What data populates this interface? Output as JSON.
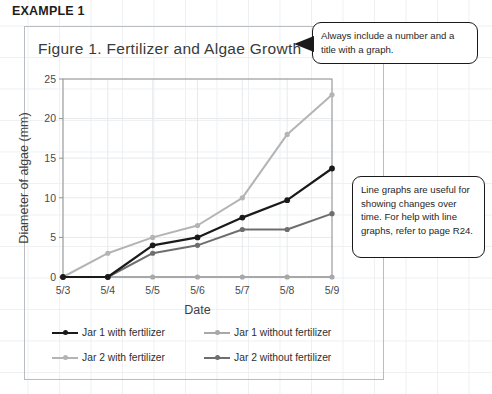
{
  "heading": "EXAMPLE 1",
  "figure": {
    "title": "Figure 1. Fertilizer and Algae Growth"
  },
  "callouts": [
    {
      "name": "title-note",
      "text": "Always include a number and a title with a graph."
    },
    {
      "name": "usage-note",
      "text": "Line graphs are useful for showing changes over time. For help with line graphs, refer to page R24."
    }
  ],
  "legend": {
    "items": [
      {
        "label": "Jar 1 with fertilizer",
        "color": "#1a1a1a"
      },
      {
        "label": "Jar 1 without fertilizer",
        "color": "#a8a8a8"
      },
      {
        "label": "Jar 2 with fertilizer",
        "color": "#b4b4b4"
      },
      {
        "label": "Jar 2 without fertilizer",
        "color": "#6e6e6e"
      }
    ]
  },
  "chart_data": {
    "type": "line",
    "title": "Figure 1. Fertilizer and Algae Growth",
    "xlabel": "Date",
    "ylabel": "Diameter of algae (mm)",
    "categories": [
      "5/3",
      "5/4",
      "5/5",
      "5/6",
      "5/7",
      "5/8",
      "5/9"
    ],
    "ylim": [
      0,
      25
    ],
    "yticks": [
      0,
      5,
      10,
      15,
      20,
      25
    ],
    "grid": true,
    "legend_position": "bottom",
    "series": [
      {
        "name": "Jar 1 with fertilizer",
        "color": "#1a1a1a",
        "values": [
          0,
          0,
          4,
          5,
          7.5,
          9.7,
          13.7
        ]
      },
      {
        "name": "Jar 1 without fertilizer",
        "color": "#a8a8a8",
        "values": [
          0,
          0,
          0,
          0,
          0,
          0,
          0
        ]
      },
      {
        "name": "Jar 2 with fertilizer",
        "color": "#b4b4b4",
        "values": [
          0,
          3,
          5,
          6.5,
          10,
          18,
          23
        ]
      },
      {
        "name": "Jar 2 without fertilizer",
        "color": "#6e6e6e",
        "values": [
          0,
          0,
          3,
          4,
          6,
          6,
          8
        ]
      }
    ]
  }
}
